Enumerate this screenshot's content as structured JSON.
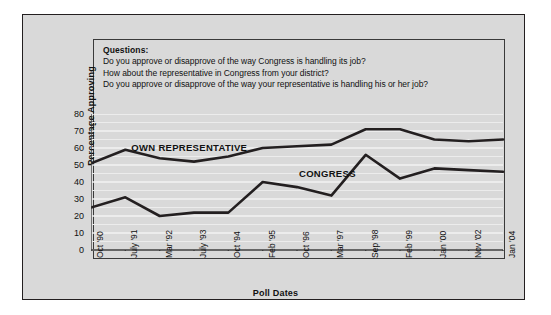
{
  "questions": {
    "heading": "Questions:",
    "lines": [
      "Do you approve or disapprove of the way Congress is handling its job?",
      "How about the representative in Congress from your district?",
      "Do you approve or disapprove of the way your representative is handling his or her job?"
    ]
  },
  "annotations": {
    "own_representative": "OWN REPRESENTATIVE",
    "congress": "CONGRESS"
  },
  "colors": {
    "background": "#d9d9d9",
    "line": "#231f20",
    "gridline": "#f2f2f2",
    "axis": "#3a3a3a",
    "text": "#111111"
  },
  "chart_data": {
    "type": "line",
    "title": "",
    "xlabel": "Poll Dates",
    "ylabel": "Percentage Approving",
    "ylim": [
      0,
      80
    ],
    "yticks": [
      0,
      10,
      20,
      30,
      40,
      50,
      60,
      70,
      80
    ],
    "grid": true,
    "legend": "inline-annotation",
    "categories": [
      "Oct '90",
      "July '91",
      "Mar '92",
      "July '93",
      "Oct '94",
      "Feb '95",
      "Oct '96",
      "Mar '97",
      "Sep '98",
      "Feb '99",
      "Jan '00",
      "Nov '02",
      "Jan '04"
    ],
    "series": [
      {
        "name": "OWN REPRESENTATIVE",
        "values": [
          51,
          59,
          54,
          52,
          55,
          60,
          61,
          62,
          71,
          71,
          65,
          64,
          65
        ]
      },
      {
        "name": "CONGRESS",
        "values": [
          25,
          31,
          20,
          22,
          22,
          40,
          37,
          32,
          56,
          42,
          48,
          47,
          46
        ]
      }
    ]
  }
}
